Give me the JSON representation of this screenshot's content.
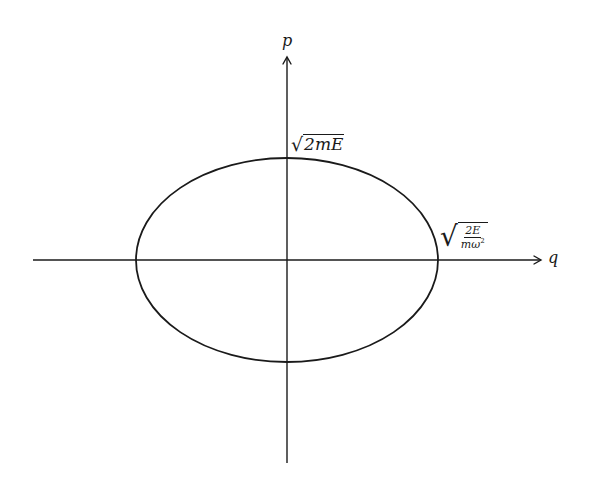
{
  "diagram": {
    "type": "phase-space-ellipse",
    "axes": {
      "horizontal": {
        "label": "q"
      },
      "vertical": {
        "label": "p"
      }
    },
    "intercepts": {
      "p_max": {
        "radicand": "2mE",
        "display": "√2mE"
      },
      "q_max": {
        "numerator": "2E",
        "denominator_base": "mω",
        "denominator_exp": "2",
        "display": "√(2E/mω²)"
      }
    },
    "colors": {
      "stroke": "#1a1a1a",
      "background": "#ffffff"
    },
    "geometry": {
      "center": [
        287,
        260
      ],
      "rx": 151,
      "ry": 102,
      "h_axis": [
        33,
        541
      ],
      "v_axis": [
        463,
        57
      ]
    }
  }
}
